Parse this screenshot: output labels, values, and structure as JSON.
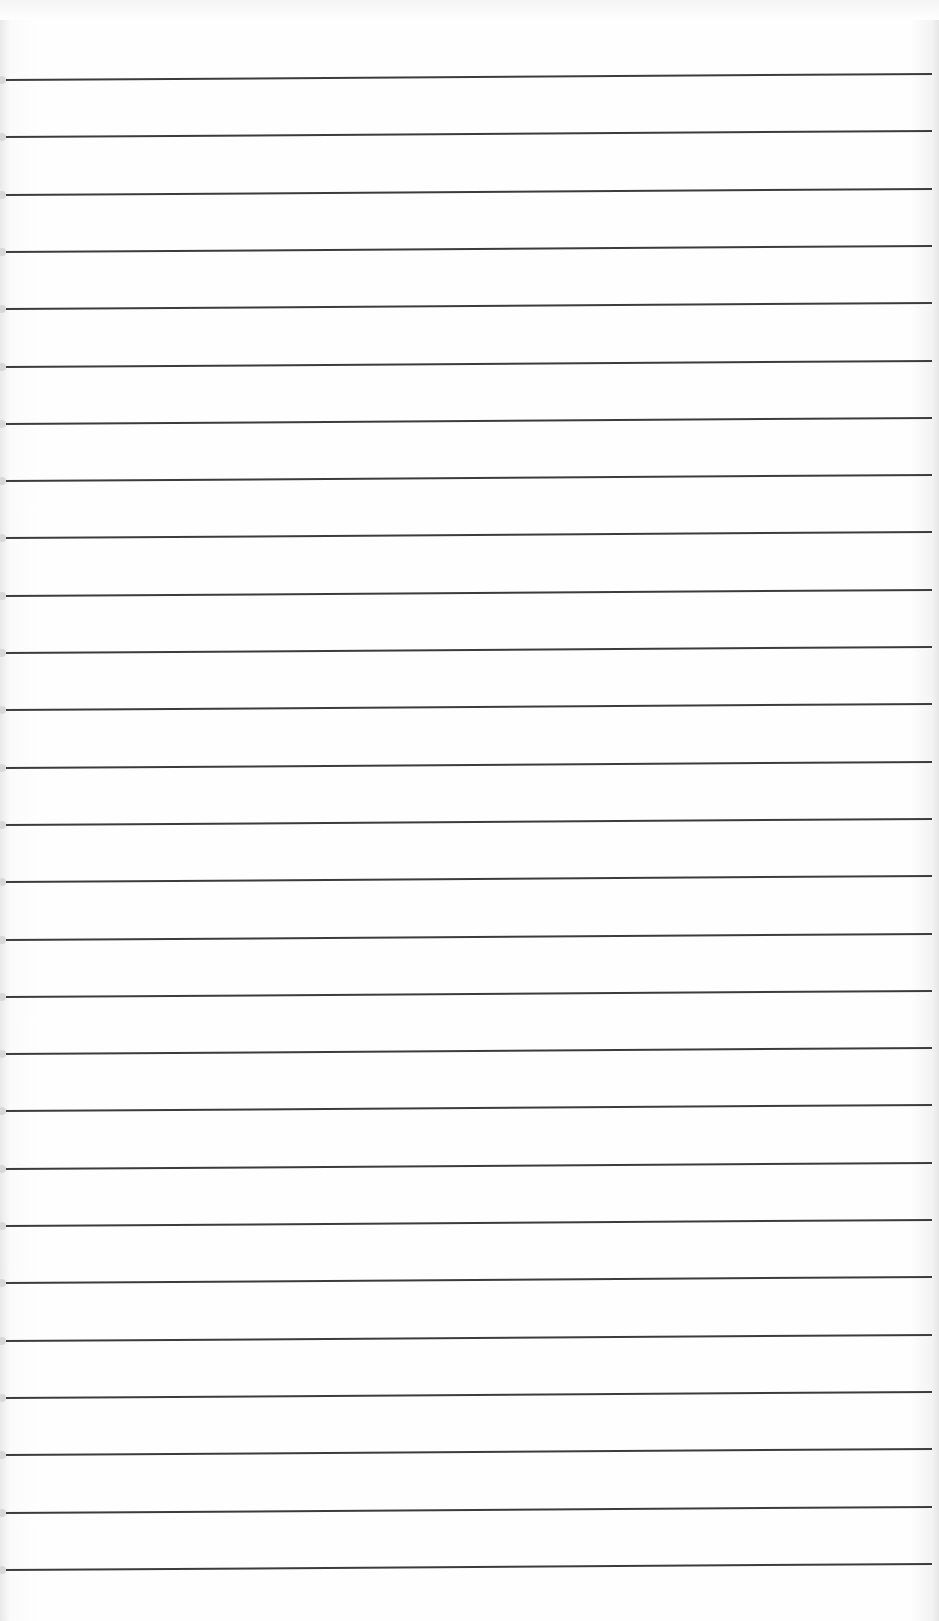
{
  "paper": {
    "type": "ruled-notepad",
    "line_count": 27,
    "first_line_y": 79,
    "line_spacing": 57.3,
    "line_color": "#3c3c3c",
    "background_color": "#fefefe"
  }
}
